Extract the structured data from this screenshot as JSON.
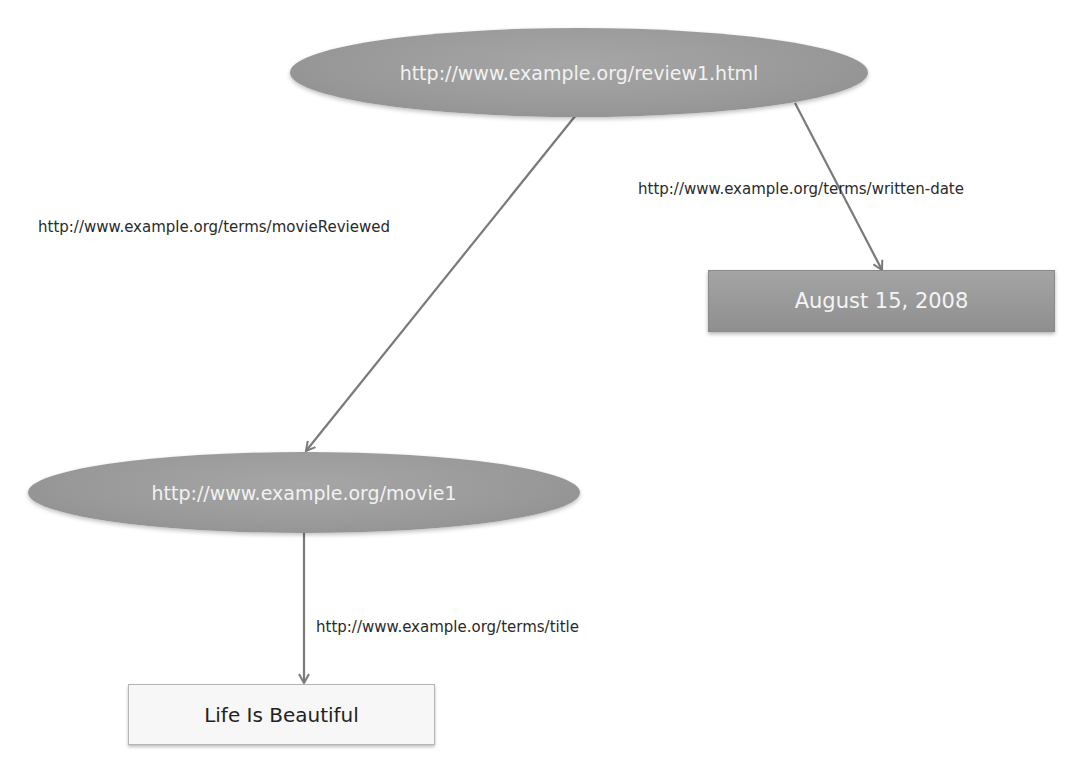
{
  "diagram": {
    "type": "rdf-graph",
    "nodes": {
      "review": {
        "label": "http://www.example.org/review1.html",
        "shape": "ellipse"
      },
      "movie": {
        "label": "http://www.example.org/movie1",
        "shape": "ellipse"
      },
      "date": {
        "label": "August 15, 2008",
        "shape": "literal-rect"
      },
      "title": {
        "label": "Life Is Beautiful",
        "shape": "literal-rect"
      }
    },
    "edges": {
      "movie_reviewed": {
        "from": "review",
        "to": "movie",
        "label": "http://www.example.org/terms/movieReviewed"
      },
      "written_date": {
        "from": "review",
        "to": "date",
        "label": "http://www.example.org/terms/written-date"
      },
      "title": {
        "from": "movie",
        "to": "title",
        "label": "http://www.example.org/terms/title"
      }
    },
    "colors": {
      "resource_fill": "#9a9a9a",
      "literal_dark_fill": "#999999",
      "literal_light_fill": "#f7f7f7",
      "edge": "#7a7a7a",
      "text_dark": "#2a2a2a",
      "text_light": "#f2f2f2"
    }
  }
}
